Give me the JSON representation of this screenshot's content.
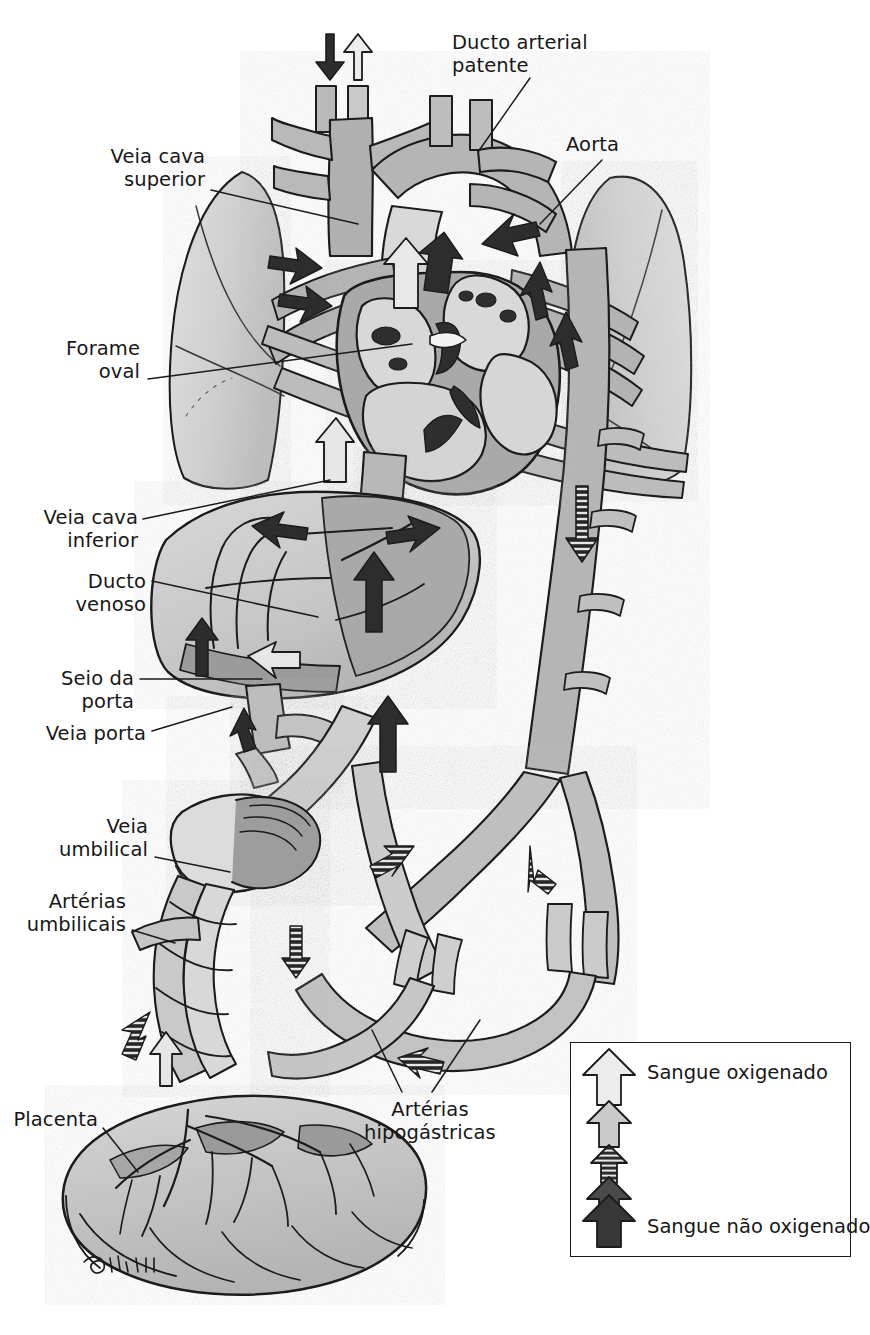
{
  "figure": {
    "type": "anatomical-diagram",
    "language": "pt-BR",
    "signature": "Sims"
  },
  "labels": [
    {
      "id": "ducto-arterial-patente",
      "text": "Ducto arterial\npatente",
      "align": "left",
      "x": 452,
      "y": 31,
      "leader": [
        [
          530,
          78
        ],
        [
          478,
          152
        ]
      ]
    },
    {
      "id": "aorta",
      "text": "Aorta",
      "align": "left",
      "x": 566,
      "y": 133,
      "leader": [
        [
          602,
          160
        ],
        [
          540,
          224
        ]
      ]
    },
    {
      "id": "veia-cava-superior",
      "text": "Veia cava\nsuperior",
      "align": "right",
      "x": 18,
      "y": 145,
      "leader": [
        [
          211,
          190
        ],
        [
          358,
          224
        ]
      ]
    },
    {
      "id": "forame-oval",
      "text": "Forame\noval",
      "align": "right",
      "x": 18,
      "y": 337,
      "leader": [
        [
          148,
          379
        ],
        [
          412,
          344
        ]
      ]
    },
    {
      "id": "veia-cava-inferior",
      "text": "Veia cava\ninferior",
      "align": "right",
      "x": 18,
      "y": 506,
      "leader": [
        [
          143,
          519
        ],
        [
          330,
          480
        ]
      ]
    },
    {
      "id": "ducto-venoso",
      "text": "Ducto\nvenoso",
      "align": "right",
      "x": 18,
      "y": 570,
      "leader": [
        [
          152,
          581
        ],
        [
          318,
          617
        ]
      ]
    },
    {
      "id": "seio-da-porta",
      "text": "Seio da\nporta",
      "align": "right",
      "x": 18,
      "y": 667,
      "leader": [
        [
          140,
          679
        ],
        [
          262,
          679
        ]
      ]
    },
    {
      "id": "veia-porta",
      "text": "Veia porta",
      "align": "right",
      "x": 18,
      "y": 722,
      "leader": [
        [
          152,
          731
        ],
        [
          232,
          707
        ]
      ]
    },
    {
      "id": "veia-umbilical",
      "text": "Veia\numbilical",
      "align": "right",
      "x": 18,
      "y": 815,
      "leader": [
        [
          155,
          857
        ],
        [
          230,
          872
        ]
      ]
    },
    {
      "id": "arterias-umbilicais",
      "text": "Artérias\numbilicais",
      "align": "right",
      "x": 18,
      "y": 890,
      "leader": [
        [
          132,
          930
        ],
        [
          175,
          943
        ]
      ]
    },
    {
      "id": "placenta",
      "text": "Placenta",
      "align": "right",
      "x": 18,
      "y": 1108,
      "leader": [
        [
          103,
          1128
        ],
        [
          138,
          1172
        ]
      ]
    },
    {
      "id": "arterias-hipogastricas",
      "text": "Artérias\nhipogástricas",
      "align": "center",
      "x": 380,
      "y": 1098,
      "leader": [
        [
          402,
          1092
        ],
        [
          372,
          1030
        ]
      ]
    }
  ],
  "legend": {
    "title_oxygenated": "Sangue oxigenado",
    "title_deoxygenated": "Sangue não oxigenado",
    "arrows": [
      {
        "id": "legend-arrow-1",
        "shade": "#e8e8e8",
        "label": "Sangue oxigenado",
        "size": "large"
      },
      {
        "id": "legend-arrow-2",
        "shade": "#c8c8c8",
        "label": "",
        "size": "medium"
      },
      {
        "id": "legend-arrow-3",
        "shade": "#8e8e8e",
        "label": "",
        "size": "small-striped"
      },
      {
        "id": "legend-arrow-4",
        "shade": "#555555",
        "label": "",
        "size": "medium"
      },
      {
        "id": "legend-arrow-5",
        "shade": "#3a3a3a",
        "label": "Sangue não oxigenado",
        "size": "large"
      }
    ]
  },
  "colors": {
    "oxygenated_light": "#e2e2e2",
    "mixed_mid": "#b9b9b9",
    "mixed_dark": "#9a9a9a",
    "deoxygenated_dark": "#2f2f2f",
    "outline": "#1b1b1b",
    "lung": "#d2d2d2",
    "background": "#ffffff"
  },
  "flow_arrows": [
    {
      "id": "arrow-trachea-in",
      "direction": "down",
      "shade": "dark",
      "note": "ar inspirado"
    },
    {
      "id": "arrow-trachea-out",
      "direction": "up",
      "shade": "light",
      "note": "ar expirado"
    }
  ]
}
